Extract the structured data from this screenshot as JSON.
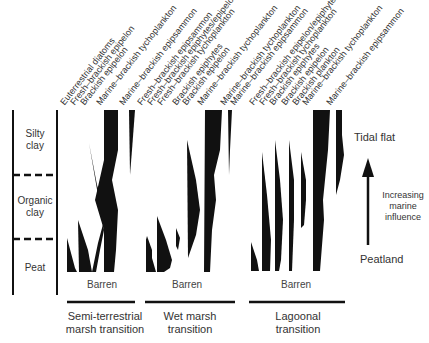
{
  "stratigraphy": {
    "units": [
      {
        "label": "Silty\nclay",
        "line1": "Silty",
        "line2": "clay"
      },
      {
        "label": "Organic\nclay",
        "line1": "Organic",
        "line2": "clay"
      },
      {
        "label": "Peat",
        "line1": "Peat"
      }
    ]
  },
  "groups": [
    {
      "name": "semi-terrestrial",
      "title_line1": "Semi-terrestrial",
      "title_line2": "marsh transition",
      "barren": "Barren",
      "taxa": [
        "Euterrestrial diatoms",
        "Fresh–brackish epipelon",
        "Brackish epipelon",
        "Marine–brackish tychoplankton",
        "Marine–brackish epipsammon"
      ]
    },
    {
      "name": "wet-marsh",
      "title_line1": "Wet marsh",
      "title_line2": "transition",
      "barren": "Barren",
      "taxa": [
        "Fresh–brackish epipsammon",
        "Fresh–brackish epiphytes/epipelon",
        "Fresh–brackish tychoplankton",
        "Brackish epiphytes",
        "Brackish epipelon",
        "Marine–brackish tychoplankton",
        "Marine–brackish tychoplankton"
      ]
    },
    {
      "name": "lagoonal",
      "title_line1": "Lagoonal",
      "title_line2": "transition",
      "barren": "Barren",
      "taxa": [
        "Marine–brackish epipsammon",
        "Fresh–brackish epipelon/epiphytes",
        "Fresh–brackish tychoplankton",
        "Brackish epiphytes",
        "Brackish epipelon",
        "Brackish plankton",
        "Marine–brackish tychoplankton",
        "Marine–brackish epipsammon"
      ]
    }
  ],
  "gradient": {
    "top": "Tidal flat",
    "bottom": "Peatland",
    "caption_line1": "Increasing",
    "caption_line2": "marine",
    "caption_line3": "influence"
  },
  "colors": {
    "ink": "#111111",
    "text": "#333333",
    "background": "#ffffff"
  }
}
